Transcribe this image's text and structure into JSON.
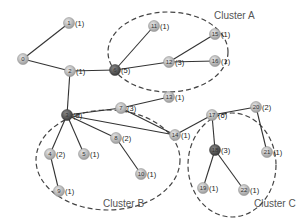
{
  "diagram": {
    "type": "network-graph",
    "colors": {
      "node_light": "#bdbdbd",
      "node_dark": "#555555",
      "edge": "#333333",
      "cluster_outline": "#444444"
    },
    "clusters": [
      {
        "id": "A",
        "label": "Cluster A",
        "cx": 168,
        "cy": 52,
        "rx": 60,
        "ry": 40,
        "label_x": 214,
        "label_y": 19
      },
      {
        "id": "B",
        "label": "Cluster B",
        "cx": 108,
        "cy": 160,
        "rx": 72,
        "ry": 50,
        "label_x": 103,
        "label_y": 207
      },
      {
        "id": "C",
        "label": "Cluster C",
        "cx": 232,
        "cy": 165,
        "rx": 44,
        "ry": 52,
        "label_x": 254,
        "label_y": 207
      }
    ],
    "nodes": [
      {
        "id": "0",
        "x": 23,
        "y": 59,
        "degree": "",
        "dark": false
      },
      {
        "id": "1",
        "x": 69,
        "y": 23,
        "degree": "(1)",
        "dark": false
      },
      {
        "id": "2",
        "x": 70,
        "y": 71,
        "degree": "(1)",
        "dark": false
      },
      {
        "id": "3",
        "x": 67,
        "y": 115,
        "degree": "(9)",
        "dark": true
      },
      {
        "id": "4",
        "x": 50,
        "y": 154,
        "degree": "(2)",
        "dark": false
      },
      {
        "id": "5",
        "x": 84,
        "y": 154,
        "degree": "(1)",
        "dark": false
      },
      {
        "id": "6",
        "x": 115,
        "y": 70,
        "degree": "(5)",
        "dark": true
      },
      {
        "id": "7",
        "x": 121,
        "y": 108,
        "degree": "(3)",
        "dark": false
      },
      {
        "id": "8",
        "x": 116,
        "y": 138,
        "degree": "(2)",
        "dark": false
      },
      {
        "id": "9",
        "x": 59,
        "y": 191,
        "degree": "(1)",
        "dark": false
      },
      {
        "id": "10",
        "x": 141,
        "y": 174,
        "degree": "(1)",
        "dark": false
      },
      {
        "id": "11",
        "x": 154,
        "y": 26,
        "degree": "(1)",
        "dark": false
      },
      {
        "id": "12",
        "x": 169,
        "y": 62,
        "degree": "(3)",
        "dark": false
      },
      {
        "id": "13",
        "x": 169,
        "y": 97,
        "degree": "(1)",
        "dark": false
      },
      {
        "id": "14",
        "x": 175,
        "y": 135,
        "degree": "(1)",
        "dark": false
      },
      {
        "id": "15",
        "x": 215,
        "y": 34,
        "degree": "(1)",
        "dark": false
      },
      {
        "id": "16",
        "x": 215,
        "y": 61,
        "degree": "(1)",
        "dark": false
      },
      {
        "id": "17",
        "x": 212,
        "y": 115,
        "degree": "(6)",
        "dark": false
      },
      {
        "id": "18",
        "x": 215,
        "y": 150,
        "degree": "(3)",
        "dark": true
      },
      {
        "id": "19",
        "x": 203,
        "y": 188,
        "degree": "(1)",
        "dark": false
      },
      {
        "id": "20",
        "x": 256,
        "y": 107,
        "degree": "(2)",
        "dark": false
      },
      {
        "id": "21",
        "x": 267,
        "y": 152,
        "degree": "(1)",
        "dark": false
      },
      {
        "id": "22",
        "x": 244,
        "y": 190,
        "degree": "(1)",
        "dark": false
      }
    ],
    "edges": [
      [
        "0",
        "1"
      ],
      [
        "0",
        "2"
      ],
      [
        "2",
        "6"
      ],
      [
        "2",
        "3"
      ],
      [
        "6",
        "11"
      ],
      [
        "6",
        "12"
      ],
      [
        "12",
        "15"
      ],
      [
        "12",
        "16"
      ],
      [
        "3",
        "7"
      ],
      [
        "3",
        "4"
      ],
      [
        "3",
        "5"
      ],
      [
        "3",
        "8"
      ],
      [
        "3",
        "14"
      ],
      [
        "4",
        "9"
      ],
      [
        "8",
        "10"
      ],
      [
        "7",
        "13"
      ],
      [
        "7",
        "14"
      ],
      [
        "14",
        "17"
      ],
      [
        "17",
        "20"
      ],
      [
        "17",
        "18"
      ],
      [
        "20",
        "21"
      ],
      [
        "18",
        "19"
      ],
      [
        "18",
        "22"
      ]
    ]
  }
}
